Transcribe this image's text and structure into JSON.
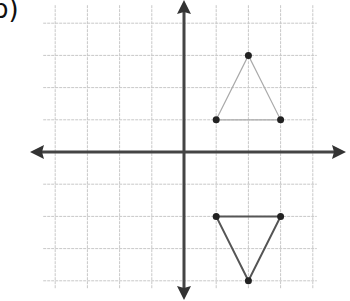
{
  "problem_label": "b)",
  "diagram": {
    "type": "coordinate-grid",
    "grid": {
      "x_min": -4,
      "x_max": 4,
      "y_min": -4,
      "y_max": 4,
      "spacing_px": 32.2
    },
    "origin_px": [
      184,
      152
    ],
    "colors": {
      "grid": "#c8c8c8",
      "axis": "#444444",
      "shape": "#555555",
      "point": "#222222"
    },
    "shapes": [
      {
        "name": "original-triangle",
        "vertices": [
          [
            1,
            1
          ],
          [
            2,
            3
          ],
          [
            3,
            1
          ]
        ]
      },
      {
        "name": "transformed-triangle",
        "vertices": [
          [
            1,
            -2
          ],
          [
            2,
            -4
          ],
          [
            3,
            -2
          ]
        ]
      }
    ]
  }
}
